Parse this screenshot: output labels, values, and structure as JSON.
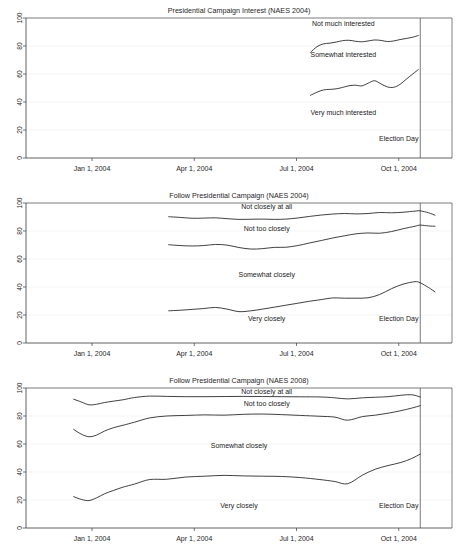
{
  "figure": {
    "panel_count": 3,
    "background": "#ffffff",
    "line_color": "#1f1f1f",
    "axis_color": "#3a3a3a",
    "grid_color": "#e8e8e8"
  },
  "chart_data": [
    {
      "type": "line",
      "title": "Presidential Campaign Interest (NAES 2004)",
      "xlabel": "",
      "ylabel": "",
      "ylim": [
        0,
        100
      ],
      "yticks": [
        0,
        20,
        40,
        60,
        80,
        100
      ],
      "ytick_labels": [
        "0",
        "20",
        "40",
        "60",
        "80",
        "100"
      ],
      "xlim": [
        "2003-11-01",
        "2004-12-15"
      ],
      "xticks": [
        "Jan 1, 2004",
        "Apr 1, 2004",
        "Jul 1, 2004",
        "Oct 1, 2004"
      ],
      "xtick_fracs": [
        0.155,
        0.395,
        0.635,
        0.875
      ],
      "grid": true,
      "legend": "inline-annotations",
      "annotations": [
        {
          "text": "Not much interested",
          "x_frac": 0.745,
          "y_value": 94
        },
        {
          "text": "Somewhat interested",
          "x_frac": 0.745,
          "y_value": 72
        },
        {
          "text": "Very much interested",
          "x_frac": 0.745,
          "y_value": 31
        },
        {
          "text": "Election Day",
          "x_frac": 0.875,
          "y_value": 12
        }
      ],
      "event_line": {
        "label": "Election Day",
        "x_frac": 0.9255
      },
      "series": [
        {
          "name": "Not much interested",
          "x_fracs": [
            0.668,
            0.683,
            0.698,
            0.713,
            0.728,
            0.743,
            0.758,
            0.773,
            0.788,
            0.803,
            0.818,
            0.833,
            0.848,
            0.863,
            0.878,
            0.893,
            0.908,
            0.921
          ],
          "values": [
            75.5,
            79.5,
            81.5,
            82.0,
            82.8,
            83.8,
            84.1,
            83.4,
            83.0,
            83.6,
            84.3,
            84.0,
            83.2,
            83.6,
            84.6,
            85.4,
            86.3,
            87.5
          ]
        },
        {
          "name": "Somewhat interested",
          "x_fracs": [
            0.668,
            0.683,
            0.698,
            0.713,
            0.728,
            0.743,
            0.758,
            0.773,
            0.788,
            0.803,
            0.818,
            0.833,
            0.848,
            0.863,
            0.878,
            0.893,
            0.908,
            0.921
          ],
          "values": [
            44.8,
            47.0,
            48.6,
            49.0,
            49.4,
            50.4,
            51.6,
            52.0,
            51.5,
            53.4,
            55.2,
            53.0,
            50.8,
            50.5,
            52.6,
            56.4,
            60.0,
            63.2
          ]
        }
      ]
    },
    {
      "type": "line",
      "title": "Follow Presidential Campaign (NAES 2004)",
      "xlabel": "",
      "ylabel": "",
      "ylim": [
        0,
        100
      ],
      "yticks": [
        0,
        20,
        40,
        60,
        80,
        100
      ],
      "ytick_labels": [
        "0",
        "20",
        "40",
        "60",
        "80",
        "100"
      ],
      "xlim": [
        "2003-11-01",
        "2004-12-15"
      ],
      "xticks": [
        "Jan 1, 2004",
        "Apr 1, 2004",
        "Jul 1, 2004",
        "Oct 1, 2004"
      ],
      "xtick_fracs": [
        0.155,
        0.395,
        0.635,
        0.875
      ],
      "grid": true,
      "legend": "inline-annotations",
      "annotations": [
        {
          "text": "Not closely at all",
          "x_frac": 0.565,
          "y_value": 96
        },
        {
          "text": "Not too closely",
          "x_frac": 0.565,
          "y_value": 80
        },
        {
          "text": "Somewhat closely",
          "x_frac": 0.565,
          "y_value": 47
        },
        {
          "text": "Very closely",
          "x_frac": 0.565,
          "y_value": 16
        },
        {
          "text": "Election Day",
          "x_frac": 0.875,
          "y_value": 16
        }
      ],
      "event_line": {
        "label": "Election Day",
        "x_frac": 0.9255
      },
      "series": [
        {
          "name": "Not closely at all",
          "x_fracs": [
            0.335,
            0.362,
            0.39,
            0.417,
            0.445,
            0.472,
            0.5,
            0.528,
            0.555,
            0.583,
            0.61,
            0.638,
            0.665,
            0.693,
            0.72,
            0.748,
            0.775,
            0.803,
            0.83,
            0.858,
            0.885,
            0.913,
            0.9255,
            0.945,
            0.96
          ],
          "values": [
            90.2,
            89.7,
            89.1,
            89.2,
            89.4,
            88.8,
            88.3,
            88.4,
            88.5,
            88.3,
            88.5,
            89.3,
            90.4,
            91.4,
            92.1,
            92.5,
            92.2,
            92.5,
            93.2,
            93.0,
            93.4,
            94.2,
            94.4,
            93.0,
            91.3
          ]
        },
        {
          "name": "Not too closely",
          "x_fracs": [
            0.335,
            0.362,
            0.39,
            0.417,
            0.445,
            0.472,
            0.5,
            0.528,
            0.555,
            0.583,
            0.61,
            0.638,
            0.665,
            0.693,
            0.72,
            0.748,
            0.775,
            0.803,
            0.83,
            0.858,
            0.885,
            0.913,
            0.9255,
            0.945,
            0.96
          ],
          "values": [
            70.2,
            69.6,
            69.3,
            69.6,
            70.4,
            69.9,
            68.2,
            67.1,
            67.4,
            68.3,
            68.4,
            69.6,
            71.4,
            73.2,
            75.0,
            76.6,
            78.0,
            78.6,
            78.4,
            79.6,
            81.6,
            83.4,
            84.2,
            83.6,
            83.4
          ]
        },
        {
          "name": "Very closely",
          "x_fracs": [
            0.335,
            0.362,
            0.39,
            0.417,
            0.445,
            0.472,
            0.5,
            0.528,
            0.555,
            0.583,
            0.61,
            0.638,
            0.665,
            0.693,
            0.72,
            0.748,
            0.775,
            0.803,
            0.83,
            0.858,
            0.885,
            0.913,
            0.9255,
            0.945,
            0.96
          ],
          "values": [
            23.0,
            23.4,
            24.0,
            24.6,
            25.4,
            24.2,
            22.4,
            23.0,
            24.2,
            25.6,
            27.0,
            28.4,
            29.8,
            31.0,
            32.2,
            32.0,
            32.0,
            32.3,
            34.6,
            38.8,
            42.0,
            43.8,
            43.0,
            39.6,
            36.6
          ]
        }
      ]
    },
    {
      "type": "line",
      "title": "Follow Presidential Campaign (NAES 2008)",
      "xlabel": "",
      "ylabel": "",
      "ylim": [
        0,
        100
      ],
      "yticks": [
        0,
        20,
        40,
        60,
        80,
        100
      ],
      "ytick_labels": [
        "0",
        "20",
        "40",
        "60",
        "80",
        "100"
      ],
      "xlim": [
        "2003-11-01",
        "2004-12-15"
      ],
      "xticks": [
        "Jan 1, 2004",
        "Apr 1, 2004",
        "Jul 1, 2004",
        "Oct 1, 2004"
      ],
      "xtick_fracs": [
        0.155,
        0.395,
        0.635,
        0.875
      ],
      "grid": true,
      "legend": "inline-annotations",
      "annotations": [
        {
          "text": "Not closely at all",
          "x_frac": 0.565,
          "y_value": 96
        },
        {
          "text": "Not too closely",
          "x_frac": 0.565,
          "y_value": 87
        },
        {
          "text": "Somewhat closely",
          "x_frac": 0.5,
          "y_value": 57
        },
        {
          "text": "Very closely",
          "x_frac": 0.5,
          "y_value": 14
        },
        {
          "text": "Election Day",
          "x_frac": 0.875,
          "y_value": 14
        }
      ],
      "event_line": {
        "label": "Election Day",
        "x_frac": 0.9255
      },
      "series": [
        {
          "name": "Not closely at all",
          "x_fracs": [
            0.112,
            0.13,
            0.148,
            0.166,
            0.184,
            0.205,
            0.228,
            0.255,
            0.29,
            0.33,
            0.375,
            0.42,
            0.465,
            0.51,
            0.555,
            0.6,
            0.645,
            0.69,
            0.725,
            0.755,
            0.79,
            0.82,
            0.85,
            0.88,
            0.905,
            0.9255
          ],
          "values": [
            92.0,
            90.0,
            88.0,
            88.4,
            89.6,
            90.6,
            91.6,
            93.2,
            94.2,
            94.0,
            93.8,
            93.8,
            93.9,
            94.0,
            93.9,
            93.8,
            93.7,
            93.6,
            93.0,
            92.2,
            93.0,
            93.4,
            93.8,
            94.8,
            95.2,
            93.6
          ]
        },
        {
          "name": "Not too closely",
          "x_fracs": [
            0.112,
            0.13,
            0.148,
            0.166,
            0.184,
            0.205,
            0.228,
            0.255,
            0.29,
            0.33,
            0.375,
            0.42,
            0.465,
            0.51,
            0.555,
            0.6,
            0.645,
            0.69,
            0.725,
            0.755,
            0.79,
            0.82,
            0.85,
            0.88,
            0.905,
            0.9255
          ],
          "values": [
            70.4,
            67.0,
            65.2,
            66.4,
            69.2,
            71.6,
            73.4,
            75.6,
            78.6,
            80.0,
            80.4,
            80.8,
            80.6,
            81.2,
            81.4,
            81.0,
            80.4,
            79.8,
            79.2,
            77.0,
            79.6,
            80.6,
            82.0,
            83.8,
            85.6,
            87.4
          ]
        },
        {
          "name": "Very closely",
          "x_fracs": [
            0.112,
            0.13,
            0.148,
            0.166,
            0.184,
            0.205,
            0.228,
            0.255,
            0.29,
            0.33,
            0.375,
            0.42,
            0.465,
            0.51,
            0.555,
            0.6,
            0.645,
            0.69,
            0.725,
            0.755,
            0.79,
            0.82,
            0.85,
            0.88,
            0.905,
            0.9255
          ],
          "values": [
            22.4,
            20.4,
            19.6,
            21.6,
            24.4,
            26.8,
            29.2,
            31.4,
            34.6,
            34.8,
            36.4,
            37.0,
            37.6,
            37.2,
            37.0,
            36.8,
            36.0,
            34.6,
            33.2,
            31.6,
            37.8,
            42.0,
            44.6,
            46.8,
            49.6,
            52.8
          ]
        }
      ]
    }
  ]
}
